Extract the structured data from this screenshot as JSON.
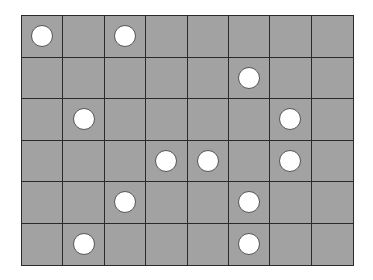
{
  "board": {
    "rows": 6,
    "cols": 8,
    "cell_color": "#a2a2a2",
    "line_color": "#2a2a2a",
    "piece_color": "#ffffff",
    "pieces": [
      {
        "row": 0,
        "col": 0
      },
      {
        "row": 0,
        "col": 2
      },
      {
        "row": 1,
        "col": 5
      },
      {
        "row": 2,
        "col": 1
      },
      {
        "row": 2,
        "col": 6
      },
      {
        "row": 3,
        "col": 3
      },
      {
        "row": 3,
        "col": 4
      },
      {
        "row": 3,
        "col": 6
      },
      {
        "row": 4,
        "col": 2
      },
      {
        "row": 4,
        "col": 5
      },
      {
        "row": 5,
        "col": 1
      },
      {
        "row": 5,
        "col": 5
      }
    ]
  }
}
